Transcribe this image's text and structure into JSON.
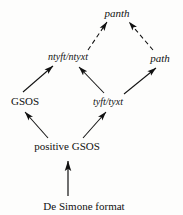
{
  "diagram": {
    "background_color": "#fdfdfc",
    "ink_color": "#111111",
    "nodes": [
      {
        "id": "panth",
        "label": "panth",
        "style": "italic",
        "x": 117,
        "y": 13
      },
      {
        "id": "ntyft",
        "label": "ntyft/ntyxt",
        "style": "italic",
        "x": 68,
        "y": 57
      },
      {
        "id": "path",
        "label": "path",
        "style": "italic",
        "x": 160,
        "y": 58
      },
      {
        "id": "gsos",
        "label": "GSOS",
        "style": "roman",
        "x": 25,
        "y": 101
      },
      {
        "id": "tyft",
        "label": "tyft/tyxt",
        "style": "italic",
        "x": 108,
        "y": 102
      },
      {
        "id": "posgsos",
        "label": "positive GSOS",
        "style": "roman",
        "x": 67,
        "y": 146
      },
      {
        "id": "desimone",
        "label": "De Simone format",
        "style": "roman",
        "x": 84,
        "y": 206
      }
    ],
    "edges": [
      {
        "id": "edge-ntyft-panth",
        "from": "ntyft",
        "to": "panth",
        "line": "dashed",
        "arrow": "single"
      },
      {
        "id": "edge-path-panth",
        "from": "path",
        "to": "panth",
        "line": "dashed",
        "arrow": "single"
      },
      {
        "id": "edge-gsos-ntyft",
        "from": "gsos",
        "to": "ntyft",
        "line": "solid",
        "arrow": "single"
      },
      {
        "id": "edge-tyft-ntyft",
        "from": "tyft",
        "to": "ntyft",
        "line": "solid",
        "arrow": "single"
      },
      {
        "id": "edge-tyft-path",
        "from": "tyft",
        "to": "path",
        "line": "solid",
        "arrow": "single"
      },
      {
        "id": "edge-posgsos-gsos",
        "from": "posgsos",
        "to": "gsos",
        "line": "solid",
        "arrow": "single"
      },
      {
        "id": "edge-posgsos-tyft",
        "from": "posgsos",
        "to": "tyft",
        "line": "solid",
        "arrow": "single"
      },
      {
        "id": "edge-desimone-posgsos",
        "from": "desimone",
        "to": "posgsos",
        "line": "solid",
        "arrow": "single"
      }
    ]
  }
}
